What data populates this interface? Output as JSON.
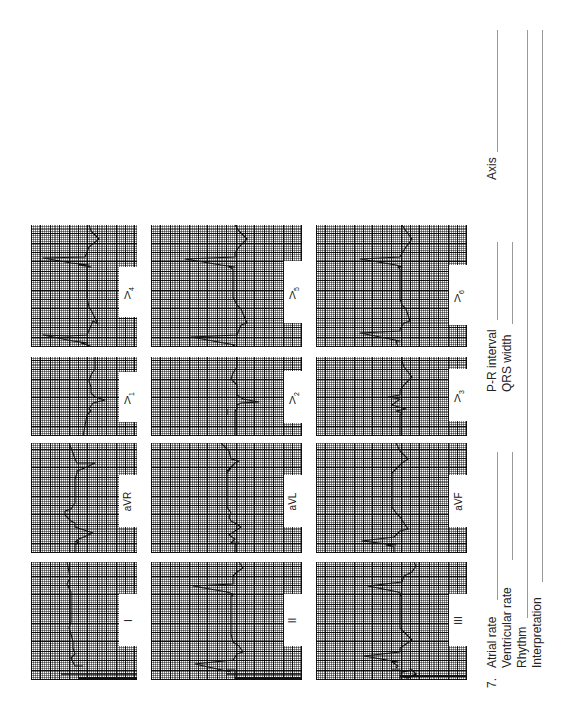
{
  "worksheet": {
    "question_number": "7.",
    "fields": {
      "atrial_rate": "Atrial rate",
      "ventricular_rate": "Ventricular rate",
      "rhythm": "Rhythm",
      "interpretation": "Interpretation",
      "pr_interval": "P-R interval",
      "qrs_width": "QRS width",
      "axis": "Axis"
    }
  },
  "leads": {
    "col1": {
      "top": {
        "name": "V",
        "sub": "4"
      },
      "second": {
        "name": "V",
        "sub": "1"
      },
      "third": {
        "name": "aVR",
        "sub": ""
      },
      "bottom": {
        "name": "I",
        "sub": ""
      }
    },
    "col2": {
      "top": {
        "name": "V",
        "sub": "5"
      },
      "second": {
        "name": "V",
        "sub": "2"
      },
      "third": {
        "name": "aVL",
        "sub": ""
      },
      "bottom": {
        "name": "II",
        "sub": ""
      }
    },
    "col3": {
      "top": {
        "name": "V",
        "sub": "6"
      },
      "second": {
        "name": "V",
        "sub": "3"
      },
      "third": {
        "name": "aVF",
        "sub": ""
      },
      "bottom": {
        "name": "III",
        "sub": ""
      }
    }
  },
  "colors": {
    "grid": "#000000",
    "trace": "#111111",
    "paper": "#ffffff"
  }
}
